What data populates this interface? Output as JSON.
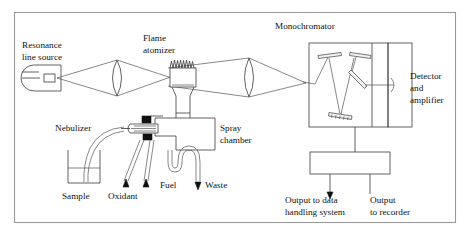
{
  "diagram": {
    "type": "instrument-schematic",
    "frame": {
      "x": 14,
      "y": 12,
      "width": 441,
      "height": 210,
      "border_color": "#9a9a9a"
    },
    "colors": {
      "line": "#3a3a3a",
      "thin_line": "#555555",
      "text": "#111111",
      "fill": "#ffffff",
      "block": "#111111"
    },
    "labels": {
      "resonance_line_1": "Resonance",
      "resonance_line_2": "line source",
      "flame_line_1": "Flame",
      "flame_line_2": "atomizer",
      "monochromator": "Monochromator",
      "detector_line_1": "Detector",
      "detector_line_2": "and",
      "detector_line_3": "amplifier",
      "nebulizer": "Nebulizer",
      "spray_line_1": "Spray",
      "spray_line_2": "chamber",
      "sample": "Sample",
      "oxidant": "Oxidant",
      "fuel": "Fuel",
      "waste": "Waste",
      "output_data_line_1": "Output to data",
      "output_data_line_2": "handling system",
      "output_recorder_line_1": "Output",
      "output_recorder_line_2": "to recorder"
    },
    "components": [
      {
        "name": "resonance-line-source-lamp",
        "label": "Resonance line source"
      },
      {
        "name": "collimating-lens-left",
        "label": ""
      },
      {
        "name": "flame-atomizer-burner",
        "label": "Flame atomizer"
      },
      {
        "name": "focusing-lens-right",
        "label": ""
      },
      {
        "name": "monochromator-housing",
        "label": "Monochromator"
      },
      {
        "name": "entrance-mirror",
        "label": ""
      },
      {
        "name": "collimating-mirror-left",
        "label": ""
      },
      {
        "name": "diffraction-grating",
        "label": ""
      },
      {
        "name": "collimating-mirror-right",
        "label": ""
      },
      {
        "name": "exit-slit-mirror",
        "label": ""
      },
      {
        "name": "detector-and-amplifier",
        "label": "Detector and amplifier"
      },
      {
        "name": "readout-electronics-box",
        "label": ""
      },
      {
        "name": "nebulizer-assembly",
        "label": "Nebulizer"
      },
      {
        "name": "spray-chamber",
        "label": "Spray chamber"
      },
      {
        "name": "sample-beaker",
        "label": "Sample"
      },
      {
        "name": "oxidant-inlet",
        "label": "Oxidant"
      },
      {
        "name": "fuel-inlet",
        "label": "Fuel"
      },
      {
        "name": "waste-drain",
        "label": "Waste"
      }
    ],
    "icons": {
      "flame": "flame-squiggle-icon",
      "arrow_up": "arrow-up-icon",
      "arrow_down": "arrow-down-icon"
    }
  }
}
